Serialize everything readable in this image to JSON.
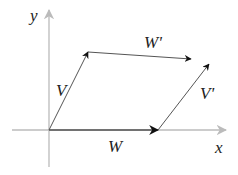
{
  "diagram": {
    "axes": {
      "x_label": "x",
      "y_label": "y",
      "axis_color": "#b8b8b8"
    },
    "vectors": [
      {
        "id": "W",
        "label": "W",
        "from": [
          49,
          130
        ],
        "to": [
          158,
          130
        ]
      },
      {
        "id": "V",
        "label": "V",
        "from": [
          49,
          130
        ],
        "to": [
          88,
          52
        ]
      },
      {
        "id": "Wp",
        "label": "W'",
        "from": [
          88,
          52
        ],
        "to": [
          191,
          59
        ]
      },
      {
        "id": "Vp",
        "label": "V'",
        "from": [
          158,
          130
        ],
        "to": [
          209,
          64
        ]
      }
    ],
    "vector_color": "#333333"
  }
}
